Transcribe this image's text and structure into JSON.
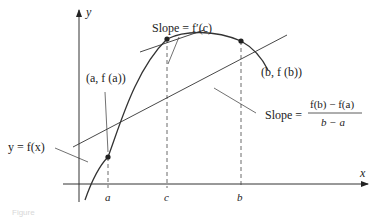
{
  "figure": {
    "axes": {
      "x_label": "x",
      "y_label": "y"
    },
    "ticks": {
      "a": "a",
      "c": "c",
      "b": "b"
    },
    "points": {
      "a_point": "(a, f (a))",
      "b_point": "(b, f (b))"
    },
    "curve_label": "y = f(x)",
    "tangent_label": "Slope = f′(c)",
    "secant_label": {
      "prefix": "Slope =",
      "numerator": "f(b) − f(a)",
      "denominator": "b − a"
    },
    "caption": "Figure"
  },
  "colors": {
    "stroke": "#333333",
    "text": "#222222"
  }
}
